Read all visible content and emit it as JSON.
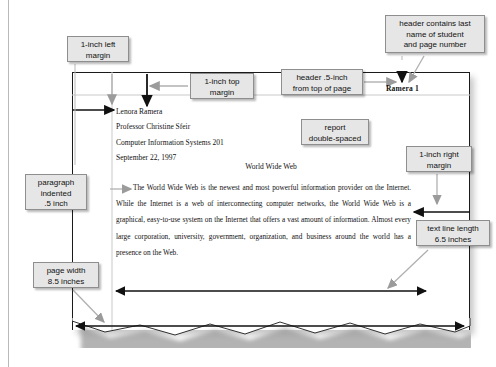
{
  "figure": {
    "kind": "annotated-document-diagram",
    "colors": {
      "callout_fill": "#e6e6e6",
      "callout_border": "#8e8e8e",
      "page_border": "#1a1a1a",
      "guide_line": "#c9c9c9",
      "black_arrow": "#111111",
      "gray_arrow": "#9b9b9b",
      "page_shadow": "#9a9a9a"
    }
  },
  "document": {
    "running_header": "Ramera 1",
    "title": "World Wide Web",
    "name_block": [
      "Lenora Ramera",
      "Professor Christine Sfeir",
      "Computer Information Systems 201",
      "September 22, 1997"
    ],
    "body_paragraph": "The World Wide Web is the newest and most powerful information provider on the Internet. While the Internet is a web of interconnecting computer networks, the World Wide Web is a graphical, easy-to-use system on the Internet that offers a vast amount of information. Almost every large corporation, university, government, organization, and business around the world has a presence on the Web."
  },
  "callouts": [
    {
      "id": "left-margin",
      "label": "1-inch left\nmargin",
      "lines": [
        "1-inch left",
        "margin"
      ]
    },
    {
      "id": "top-margin",
      "label": "1-inch top\nmargin",
      "lines": [
        "1-inch top",
        "margin"
      ]
    },
    {
      "id": "header-pos",
      "label": "header .5-inch\nfrom top of page",
      "lines": [
        "header .5-inch",
        "from top of page"
      ]
    },
    {
      "id": "header-content",
      "label": "header contains last\nname of student\nand page number",
      "lines": [
        "header contains last",
        "name of student",
        "and page number"
      ]
    },
    {
      "id": "double-spaced",
      "label": "report\ndouble-spaced",
      "lines": [
        "report",
        "double-spaced"
      ]
    },
    {
      "id": "right-margin",
      "label": "1-inch right\nmargin",
      "lines": [
        "1-inch right",
        "margin"
      ]
    },
    {
      "id": "paragraph-indent",
      "label": "paragraph\nindented\n.5 inch",
      "lines": [
        "paragraph",
        "indented",
        ".5 inch"
      ]
    },
    {
      "id": "line-length",
      "label": "text line length\n6.5 inches",
      "lines": [
        "text line length",
        "6.5 inches"
      ]
    },
    {
      "id": "page-width",
      "label": "page width\n8.5 inches",
      "lines": [
        "page width",
        "8.5 inches"
      ]
    }
  ]
}
